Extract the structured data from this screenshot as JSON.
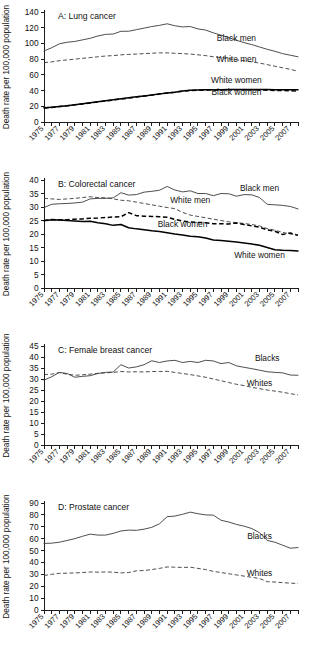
{
  "figure": {
    "width": 310,
    "height": 656,
    "y_axis_title": "Death rate per 100,000 population",
    "x_tick_labels": [
      "1975",
      "1977",
      "1979",
      "1981",
      "1983",
      "1985",
      "1987",
      "1989",
      "1991",
      "1993",
      "1995",
      "1997",
      "1999",
      "2001",
      "2003",
      "2005",
      "2007"
    ],
    "years": [
      1975,
      1976,
      1977,
      1978,
      1979,
      1980,
      1981,
      1982,
      1983,
      1984,
      1985,
      1986,
      1987,
      1988,
      1989,
      1990,
      1991,
      1992,
      1993,
      1994,
      1995,
      1996,
      1997,
      1998,
      1999,
      2000,
      2001,
      2002,
      2003,
      2004,
      2005,
      2006,
      2007,
      2008
    ]
  },
  "chart_data": [
    {
      "type": "line",
      "panel": "A",
      "title": "A: Lung cancer",
      "xlabel": "",
      "ylabel": "Death rate per 100,000 population",
      "ylim": [
        0,
        140
      ],
      "yticks": [
        0,
        20,
        40,
        60,
        80,
        100,
        120,
        140
      ],
      "xlim": [
        1975,
        2008
      ],
      "grid": false,
      "legend_position": "inline-right",
      "x": [
        1975,
        1976,
        1977,
        1978,
        1979,
        1980,
        1981,
        1982,
        1983,
        1984,
        1985,
        1986,
        1987,
        1988,
        1989,
        1990,
        1991,
        1992,
        1993,
        1994,
        1995,
        1996,
        1997,
        1998,
        1999,
        2000,
        2001,
        2002,
        2003,
        2004,
        2005,
        2006,
        2007,
        2008
      ],
      "series": [
        {
          "name": "Black men",
          "style": "solid-thin",
          "label_x": 2000,
          "label_y": 103,
          "values": [
            90.5,
            94.5,
            99.5,
            101.5,
            102.5,
            104.5,
            106.5,
            109.5,
            111.5,
            112.0,
            115.5,
            115.5,
            117.5,
            119.5,
            121.5,
            123.0,
            125.0,
            122.5,
            121.0,
            121.5,
            118.5,
            117.0,
            113.5,
            110.5,
            107.5,
            104.0,
            101.0,
            98.5,
            95.5,
            92.5,
            90.0,
            87.0,
            85.0,
            83.0
          ]
        },
        {
          "name": "White men",
          "style": "dash-thin",
          "label_x": 2000,
          "label_y": 76,
          "values": [
            75.5,
            76.5,
            78.0,
            79.0,
            80.0,
            81.0,
            82.0,
            83.0,
            84.0,
            84.5,
            85.5,
            86.0,
            86.5,
            87.0,
            87.5,
            88.0,
            88.0,
            87.5,
            87.0,
            86.5,
            85.5,
            84.5,
            83.0,
            82.0,
            80.5,
            79.0,
            78.0,
            76.5,
            75.0,
            73.0,
            71.0,
            69.0,
            67.0,
            64.5
          ]
        },
        {
          "name": "White women",
          "style": "solid-thick",
          "label_x": 2000,
          "label_y": 50,
          "values": [
            18.0,
            18.8,
            19.8,
            20.8,
            22.0,
            23.2,
            24.5,
            25.8,
            27.0,
            28.2,
            29.5,
            30.8,
            32.0,
            33.2,
            34.5,
            35.8,
            37.0,
            38.0,
            39.5,
            40.5,
            40.8,
            41.0,
            41.0,
            41.2,
            41.5,
            41.5,
            41.5,
            41.5,
            41.5,
            41.5,
            41.0,
            41.0,
            41.0,
            41.0
          ]
        },
        {
          "name": "Black women",
          "style": "dash-thick",
          "label_x": 2000,
          "label_y": 34,
          "values": [
            17.8,
            18.6,
            19.6,
            20.6,
            21.8,
            23.0,
            24.3,
            25.5,
            26.8,
            28.0,
            29.2,
            30.5,
            31.8,
            33.0,
            34.2,
            35.5,
            36.8,
            37.8,
            39.2,
            40.2,
            40.4,
            40.6,
            40.6,
            40.8,
            41.0,
            41.0,
            41.0,
            41.0,
            40.8,
            40.5,
            40.2,
            40.0,
            39.8,
            39.5
          ]
        }
      ]
    },
    {
      "type": "line",
      "panel": "B",
      "title": "B: Colorectal cancer",
      "xlabel": "",
      "ylabel": "Death rate per 100,000 population",
      "ylim": [
        0,
        40
      ],
      "yticks": [
        0,
        5,
        10,
        15,
        20,
        25,
        30,
        35,
        40
      ],
      "xlim": [
        1975,
        2008
      ],
      "grid": false,
      "legend_position": "inline-right",
      "x": [
        1975,
        1976,
        1977,
        1978,
        1979,
        1980,
        1981,
        1982,
        1983,
        1984,
        1985,
        1986,
        1987,
        1988,
        1989,
        1990,
        1991,
        1992,
        1993,
        1994,
        1995,
        1996,
        1997,
        1998,
        1999,
        2000,
        2001,
        2002,
        2003,
        2004,
        2005,
        2006,
        2007,
        2008
      ],
      "series": [
        {
          "name": "Black men",
          "style": "solid-thin",
          "label_x": 2003,
          "label_y": 36,
          "values": [
            29.8,
            31.0,
            31.2,
            31.3,
            31.5,
            31.8,
            33.0,
            33.2,
            33.2,
            33.4,
            35.3,
            34.4,
            34.6,
            35.5,
            35.8,
            36.2,
            37.6,
            36.3,
            35.6,
            36.0,
            35.0,
            35.0,
            34.2,
            35.0,
            34.9,
            34.0,
            34.6,
            34.5,
            33.5,
            31.0,
            30.8,
            30.6,
            30.2,
            29.3
          ]
        },
        {
          "name": "White men",
          "style": "dash-thin",
          "label_x": 1994,
          "label_y": 31.5,
          "values": [
            33.2,
            33.0,
            32.8,
            33.0,
            33.2,
            33.5,
            33.8,
            33.5,
            33.4,
            33.0,
            32.5,
            32.3,
            31.8,
            31.3,
            30.8,
            30.3,
            29.8,
            29.4,
            28.0,
            27.0,
            26.5,
            26.0,
            25.5,
            25.0,
            24.5,
            24.2,
            23.9,
            23.5,
            23.0,
            22.0,
            21.4,
            20.6,
            20.0,
            19.6
          ]
        },
        {
          "name": "Black women",
          "style": "dash-thick",
          "label_x": 1993,
          "label_y": 22.5,
          "values": [
            25.0,
            25.4,
            25.2,
            25.3,
            25.5,
            25.6,
            25.8,
            25.9,
            26.1,
            26.3,
            26.4,
            27.9,
            26.8,
            26.6,
            26.5,
            26.4,
            26.2,
            25.4,
            24.8,
            24.5,
            24.3,
            24.2,
            23.8,
            23.8,
            23.7,
            24.1,
            23.5,
            23.0,
            22.5,
            21.5,
            21.0,
            19.8,
            20.4,
            19.5
          ]
        },
        {
          "name": "White women",
          "style": "solid-thick",
          "label_x": 2003,
          "label_y": 11,
          "values": [
            24.9,
            25.3,
            25.2,
            25.0,
            24.8,
            24.6,
            24.7,
            24.2,
            23.8,
            23.2,
            23.5,
            22.3,
            21.9,
            21.6,
            21.2,
            20.9,
            20.5,
            20.0,
            19.6,
            19.2,
            19.0,
            18.5,
            17.8,
            17.6,
            17.3,
            17.0,
            16.7,
            16.3,
            15.8,
            15.0,
            14.2,
            14.0,
            13.9,
            13.7
          ]
        }
      ]
    },
    {
      "type": "line",
      "panel": "C",
      "title": "C: Female breast cancer",
      "xlabel": "",
      "ylabel": "Death rate per 100,000 population",
      "ylim": [
        0,
        45
      ],
      "yticks": [
        0,
        5,
        10,
        15,
        20,
        25,
        30,
        35,
        40,
        45
      ],
      "xlim": [
        1975,
        2008
      ],
      "grid": false,
      "legend_position": "inline-right",
      "x": [
        1975,
        1976,
        1977,
        1978,
        1979,
        1980,
        1981,
        1982,
        1983,
        1984,
        1985,
        1986,
        1987,
        1988,
        1989,
        1990,
        1991,
        1992,
        1993,
        1994,
        1995,
        1996,
        1997,
        1998,
        1999,
        2000,
        2001,
        2002,
        2003,
        2004,
        2005,
        2006,
        2007,
        2008
      ],
      "series": [
        {
          "name": "Blacks",
          "style": "solid-thin",
          "label_x": 2004,
          "label_y": 38,
          "values": [
            29.5,
            31.0,
            33.0,
            32.5,
            30.8,
            31.2,
            31.5,
            32.5,
            33.0,
            33.2,
            36.5,
            35.0,
            35.5,
            36.5,
            38.3,
            37.5,
            38.2,
            38.5,
            37.5,
            38.0,
            37.5,
            38.5,
            38.2,
            37.0,
            37.5,
            36.0,
            35.3,
            34.7,
            34.0,
            33.3,
            33.0,
            32.8,
            31.8,
            31.7
          ]
        },
        {
          "name": "Whites",
          "style": "dash-thin",
          "label_x": 2003,
          "label_y": 27,
          "values": [
            32.0,
            32.2,
            32.9,
            32.2,
            31.7,
            31.9,
            32.2,
            32.6,
            32.8,
            33.0,
            33.4,
            33.2,
            33.3,
            33.2,
            33.4,
            33.4,
            33.5,
            33.0,
            32.5,
            32.0,
            31.4,
            30.8,
            30.0,
            29.2,
            28.4,
            27.6,
            27.0,
            26.2,
            25.6,
            25.0,
            24.5,
            24.0,
            23.3,
            22.8
          ]
        }
      ]
    },
    {
      "type": "line",
      "panel": "D",
      "title": "D: Prostate cancer",
      "xlabel": "",
      "ylabel": "Death rate per 100,000 population",
      "ylim": [
        0,
        90
      ],
      "yticks": [
        0,
        10,
        20,
        30,
        40,
        50,
        60,
        70,
        80,
        90
      ],
      "xlim": [
        1975,
        2008
      ],
      "grid": false,
      "legend_position": "inline-right",
      "x": [
        1975,
        1976,
        1977,
        1978,
        1979,
        1980,
        1981,
        1982,
        1983,
        1984,
        1985,
        1986,
        1987,
        1988,
        1989,
        1990,
        1991,
        1992,
        1993,
        1994,
        1995,
        1996,
        1997,
        1998,
        1999,
        2000,
        2001,
        2002,
        2003,
        2004,
        2005,
        2006,
        2007,
        2008
      ],
      "series": [
        {
          "name": "Blacks",
          "style": "solid-thin",
          "label_x": 2003,
          "label_y": 60,
          "values": [
            56.0,
            56.2,
            57.0,
            58.5,
            60.0,
            62.0,
            63.8,
            63.0,
            63.0,
            64.5,
            66.5,
            67.2,
            67.0,
            68.0,
            69.5,
            72.5,
            78.5,
            79.0,
            80.5,
            82.3,
            81.0,
            80.0,
            79.8,
            75.5,
            74.0,
            72.0,
            70.5,
            68.5,
            65.0,
            58.5,
            57.0,
            54.5,
            52.0,
            52.5
          ]
        },
        {
          "name": "Whites",
          "style": "dash-thin",
          "label_x": 2003,
          "label_y": 29,
          "values": [
            29.0,
            30.0,
            30.8,
            31.0,
            31.2,
            31.5,
            32.0,
            31.8,
            32.0,
            31.8,
            31.2,
            31.5,
            33.0,
            33.2,
            34.0,
            35.0,
            36.2,
            36.0,
            35.8,
            36.0,
            35.0,
            34.0,
            32.5,
            31.5,
            30.5,
            29.5,
            28.5,
            27.5,
            26.5,
            23.8,
            23.5,
            23.0,
            22.6,
            22.3
          ]
        }
      ]
    }
  ]
}
